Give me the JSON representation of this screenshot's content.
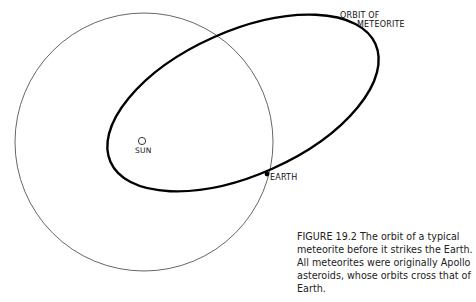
{
  "labels": {
    "orbit_line1": "ORBIT OF",
    "orbit_line2": "METEORITE",
    "sun": "SUN",
    "earth": "EARTH"
  },
  "caption": {
    "line1": "FIGURE  19.2  The orbit of a typical",
    "line2": "meteorite before it strikes the Earth.",
    "line3": "All meteorites were originally Apollo",
    "line4": "asteroids, whose orbits cross that of",
    "line5": "Earth."
  },
  "colors": {
    "earth_orbit": "#555555",
    "meteorite_orbit": "#000000",
    "text": "#222222"
  }
}
